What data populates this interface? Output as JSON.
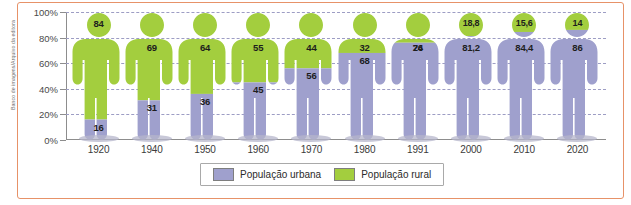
{
  "credit": "Banco de imagens/Arquivo da editora",
  "colors": {
    "rural": "#a3ce3e",
    "urban": "#9fa0cd",
    "frame": "#e79268",
    "grid": "#9d9dc4",
    "axis": "#8d8d8d"
  },
  "legend": {
    "items": [
      {
        "label": "População urbana",
        "color": "#9fa0cd",
        "key": "urban"
      },
      {
        "label": "População rural",
        "color": "#a3ce3e",
        "key": "rural"
      }
    ]
  },
  "chart_data": {
    "type": "bar",
    "title": "",
    "xlabel": "",
    "ylabel": "",
    "ylim": [
      0,
      100
    ],
    "grid": true,
    "legend_position": "bottom",
    "ytick_labels": [
      "100%",
      "80%",
      "60%",
      "40%",
      "20%",
      "0%"
    ],
    "ytick_values": [
      100,
      80,
      60,
      40,
      20,
      0
    ],
    "categories": [
      "1920",
      "1940",
      "1950",
      "1960",
      "1970",
      "1980",
      "1991",
      "2000",
      "2010",
      "2020"
    ],
    "series": [
      {
        "name": "População rural",
        "color": "#a3ce3e",
        "values": [
          84,
          69,
          64,
          55,
          44,
          32,
          24,
          18.8,
          15.6,
          14
        ],
        "labels": [
          "84",
          "69",
          "64",
          "55",
          "44",
          "32",
          "24",
          "18,8",
          "15,6",
          "14"
        ]
      },
      {
        "name": "População urbana",
        "color": "#9fa0cd",
        "values": [
          16,
          31,
          36,
          45,
          56,
          68,
          76,
          81.2,
          84.4,
          86
        ],
        "labels": [
          "16",
          "31",
          "36",
          "45",
          "56",
          "68",
          "76",
          "81,2",
          "84,4",
          "86"
        ]
      }
    ]
  }
}
